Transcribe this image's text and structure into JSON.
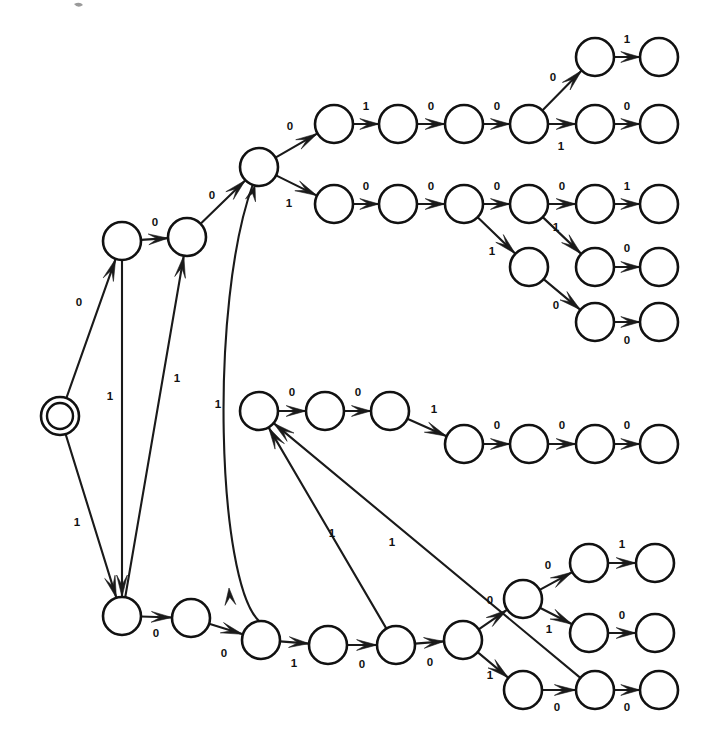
{
  "diagram": {
    "kind": "state-machine-graph",
    "alphabet": [
      "0",
      "1"
    ],
    "stroke_color": "#111111",
    "background_color": "#ffffff",
    "start_state_id": "q0",
    "node_radius": 19,
    "start_node_outer_radius": 19,
    "start_node_inner_radius": 13,
    "states": [
      {
        "id": "q0",
        "x": 60,
        "y": 416,
        "accepting": true,
        "label": ""
      },
      {
        "id": "a1",
        "x": 122,
        "y": 241,
        "accepting": false,
        "label": ""
      },
      {
        "id": "a2",
        "x": 187,
        "y": 237,
        "accepting": false,
        "label": ""
      },
      {
        "id": "hub",
        "x": 259,
        "y": 167,
        "accepting": false,
        "label": ""
      },
      {
        "id": "t1",
        "x": 334,
        "y": 124,
        "accepting": false,
        "label": ""
      },
      {
        "id": "t2",
        "x": 398,
        "y": 124,
        "accepting": false,
        "label": ""
      },
      {
        "id": "t3",
        "x": 464,
        "y": 124,
        "accepting": false,
        "label": ""
      },
      {
        "id": "t4",
        "x": 529,
        "y": 124,
        "accepting": false,
        "label": ""
      },
      {
        "id": "t5",
        "x": 595,
        "y": 57,
        "accepting": false,
        "label": ""
      },
      {
        "id": "t6",
        "x": 659,
        "y": 57,
        "accepting": false,
        "label": ""
      },
      {
        "id": "t7",
        "x": 595,
        "y": 124,
        "accepting": false,
        "label": ""
      },
      {
        "id": "t8",
        "x": 659,
        "y": 124,
        "accepting": false,
        "label": ""
      },
      {
        "id": "u1",
        "x": 334,
        "y": 204,
        "accepting": false,
        "label": ""
      },
      {
        "id": "u2",
        "x": 398,
        "y": 204,
        "accepting": false,
        "label": ""
      },
      {
        "id": "u3",
        "x": 464,
        "y": 204,
        "accepting": false,
        "label": ""
      },
      {
        "id": "u4",
        "x": 529,
        "y": 204,
        "accepting": false,
        "label": ""
      },
      {
        "id": "u5",
        "x": 595,
        "y": 204,
        "accepting": false,
        "label": ""
      },
      {
        "id": "u6",
        "x": 659,
        "y": 204,
        "accepting": false,
        "label": ""
      },
      {
        "id": "u7",
        "x": 529,
        "y": 267,
        "accepting": false,
        "label": ""
      },
      {
        "id": "u8",
        "x": 595,
        "y": 267,
        "accepting": false,
        "label": ""
      },
      {
        "id": "u9",
        "x": 659,
        "y": 267,
        "accepting": false,
        "label": ""
      },
      {
        "id": "u10",
        "x": 595,
        "y": 322,
        "accepting": false,
        "label": ""
      },
      {
        "id": "u11",
        "x": 659,
        "y": 322,
        "accepting": false,
        "label": ""
      },
      {
        "id": "m0",
        "x": 259,
        "y": 411,
        "accepting": false,
        "label": ""
      },
      {
        "id": "m1",
        "x": 325,
        "y": 411,
        "accepting": false,
        "label": ""
      },
      {
        "id": "m2",
        "x": 390,
        "y": 411,
        "accepting": false,
        "label": ""
      },
      {
        "id": "m3",
        "x": 464,
        "y": 444,
        "accepting": false,
        "label": ""
      },
      {
        "id": "m4",
        "x": 529,
        "y": 444,
        "accepting": false,
        "label": ""
      },
      {
        "id": "m5",
        "x": 595,
        "y": 444,
        "accepting": false,
        "label": ""
      },
      {
        "id": "m6",
        "x": 659,
        "y": 444,
        "accepting": false,
        "label": ""
      },
      {
        "id": "b0",
        "x": 122,
        "y": 616,
        "accepting": false,
        "label": ""
      },
      {
        "id": "b1",
        "x": 191,
        "y": 618,
        "accepting": false,
        "label": ""
      },
      {
        "id": "b2",
        "x": 261,
        "y": 640,
        "accepting": false,
        "label": ""
      },
      {
        "id": "b3",
        "x": 328,
        "y": 645,
        "accepting": false,
        "label": ""
      },
      {
        "id": "b4",
        "x": 396,
        "y": 645,
        "accepting": false,
        "label": ""
      },
      {
        "id": "b5",
        "x": 463,
        "y": 640,
        "accepting": false,
        "label": ""
      },
      {
        "id": "b6",
        "x": 523,
        "y": 599,
        "accepting": false,
        "label": ""
      },
      {
        "id": "b7",
        "x": 589,
        "y": 563,
        "accepting": false,
        "label": ""
      },
      {
        "id": "b8",
        "x": 655,
        "y": 563,
        "accepting": false,
        "label": ""
      },
      {
        "id": "b9",
        "x": 589,
        "y": 633,
        "accepting": false,
        "label": ""
      },
      {
        "id": "b10",
        "x": 655,
        "y": 633,
        "accepting": false,
        "label": ""
      },
      {
        "id": "b11",
        "x": 523,
        "y": 690,
        "accepting": false,
        "label": ""
      },
      {
        "id": "b12",
        "x": 595,
        "y": 690,
        "accepting": false,
        "label": ""
      },
      {
        "id": "b13",
        "x": 659,
        "y": 690,
        "accepting": false,
        "label": ""
      }
    ],
    "transitions": [
      {
        "from": "q0",
        "to": "a1",
        "symbol": "0",
        "lx": 79,
        "ly": 303
      },
      {
        "from": "q0",
        "to": "b0",
        "symbol": "1",
        "lx": 77,
        "ly": 523
      },
      {
        "from": "a1",
        "to": "a2",
        "symbol": "0",
        "lx": 155,
        "ly": 223
      },
      {
        "from": "a1",
        "to": "b0",
        "symbol": "1",
        "lx": 110,
        "ly": 397
      },
      {
        "from": "a2",
        "to": "hub",
        "symbol": "0",
        "lx": 212,
        "ly": 196
      },
      {
        "from": "b0",
        "to": "a2",
        "symbol": "1",
        "lx": 177,
        "ly": 379
      },
      {
        "from": "b2",
        "to": "hub",
        "symbol": "1",
        "lx": 218,
        "ly": 405
      },
      {
        "from": "hub",
        "to": "t1",
        "symbol": "0",
        "lx": 290,
        "ly": 127
      },
      {
        "from": "t1",
        "to": "t2",
        "symbol": "1",
        "lx": 366,
        "ly": 107
      },
      {
        "from": "t2",
        "to": "t3",
        "symbol": "0",
        "lx": 431,
        "ly": 107
      },
      {
        "from": "t3",
        "to": "t4",
        "symbol": "0",
        "lx": 497,
        "ly": 107
      },
      {
        "from": "t4",
        "to": "t5",
        "symbol": "0",
        "lx": 553,
        "ly": 78
      },
      {
        "from": "t5",
        "to": "t6",
        "symbol": "1",
        "lx": 627,
        "ly": 40
      },
      {
        "from": "t4",
        "to": "t7",
        "symbol": "1",
        "lx": 561,
        "ly": 147
      },
      {
        "from": "t7",
        "to": "t8",
        "symbol": "0",
        "lx": 627,
        "ly": 107
      },
      {
        "from": "hub",
        "to": "u1",
        "symbol": "1",
        "lx": 289,
        "ly": 204
      },
      {
        "from": "u1",
        "to": "u2",
        "symbol": "0",
        "lx": 366,
        "ly": 187
      },
      {
        "from": "u2",
        "to": "u3",
        "symbol": "0",
        "lx": 431,
        "ly": 187
      },
      {
        "from": "u3",
        "to": "u4",
        "symbol": "0",
        "lx": 497,
        "ly": 187
      },
      {
        "from": "u4",
        "to": "u5",
        "symbol": "0",
        "lx": 562,
        "ly": 187
      },
      {
        "from": "u5",
        "to": "u6",
        "symbol": "1",
        "lx": 627,
        "ly": 187
      },
      {
        "from": "u4",
        "to": "u8",
        "symbol": "1",
        "lx": 556,
        "ly": 228
      },
      {
        "from": "u8",
        "to": "u9",
        "symbol": "0",
        "lx": 627,
        "ly": 249
      },
      {
        "from": "u3",
        "to": "u7",
        "symbol": "1",
        "lx": 492,
        "ly": 252
      },
      {
        "from": "u7",
        "to": "u10",
        "symbol": "0",
        "lx": 556,
        "ly": 306
      },
      {
        "from": "u10",
        "to": "u11",
        "symbol": "0",
        "lx": 627,
        "ly": 341
      },
      {
        "from": "m0",
        "to": "m1",
        "symbol": "0",
        "lx": 292,
        "ly": 393
      },
      {
        "from": "m1",
        "to": "m2",
        "symbol": "0",
        "lx": 358,
        "ly": 393
      },
      {
        "from": "m2",
        "to": "m3",
        "symbol": "1",
        "lx": 434,
        "ly": 410
      },
      {
        "from": "m3",
        "to": "m4",
        "symbol": "0",
        "lx": 497,
        "ly": 426
      },
      {
        "from": "m4",
        "to": "m5",
        "symbol": "0",
        "lx": 562,
        "ly": 426
      },
      {
        "from": "m5",
        "to": "m6",
        "symbol": "0",
        "lx": 627,
        "ly": 426
      },
      {
        "from": "b4",
        "to": "m0",
        "symbol": "1",
        "lx": 332,
        "ly": 534
      },
      {
        "from": "b12",
        "to": "m0",
        "symbol": "1",
        "lx": 392,
        "ly": 543
      },
      {
        "from": "b0",
        "to": "b1",
        "symbol": "0",
        "lx": 156,
        "ly": 634
      },
      {
        "from": "b1",
        "to": "b2",
        "symbol": "0",
        "lx": 224,
        "ly": 654
      },
      {
        "from": "b2",
        "to": "b3",
        "symbol": "1",
        "lx": 294,
        "ly": 664
      },
      {
        "from": "b3",
        "to": "b4",
        "symbol": "0",
        "lx": 362,
        "ly": 665
      },
      {
        "from": "b4",
        "to": "b5",
        "symbol": "0",
        "lx": 430,
        "ly": 663
      },
      {
        "from": "b5",
        "to": "b6",
        "symbol": "0",
        "lx": 490,
        "ly": 601
      },
      {
        "from": "b6",
        "to": "b7",
        "symbol": "0",
        "lx": 548,
        "ly": 566
      },
      {
        "from": "b7",
        "to": "b8",
        "symbol": "1",
        "lx": 622,
        "ly": 545
      },
      {
        "from": "b6",
        "to": "b9",
        "symbol": "1",
        "lx": 549,
        "ly": 630
      },
      {
        "from": "b9",
        "to": "b10",
        "symbol": "0",
        "lx": 622,
        "ly": 616
      },
      {
        "from": "b5",
        "to": "b11",
        "symbol": "1",
        "lx": 490,
        "ly": 676
      },
      {
        "from": "b11",
        "to": "b12",
        "symbol": "0",
        "lx": 557,
        "ly": 708
      },
      {
        "from": "b12",
        "to": "b13",
        "symbol": "0",
        "lx": 627,
        "ly": 708
      }
    ],
    "curved_edges": [
      {
        "from": "b2",
        "to": "hub",
        "symbol": "1",
        "note": "long vertical curve from lower-middle node up to hub"
      }
    ]
  }
}
